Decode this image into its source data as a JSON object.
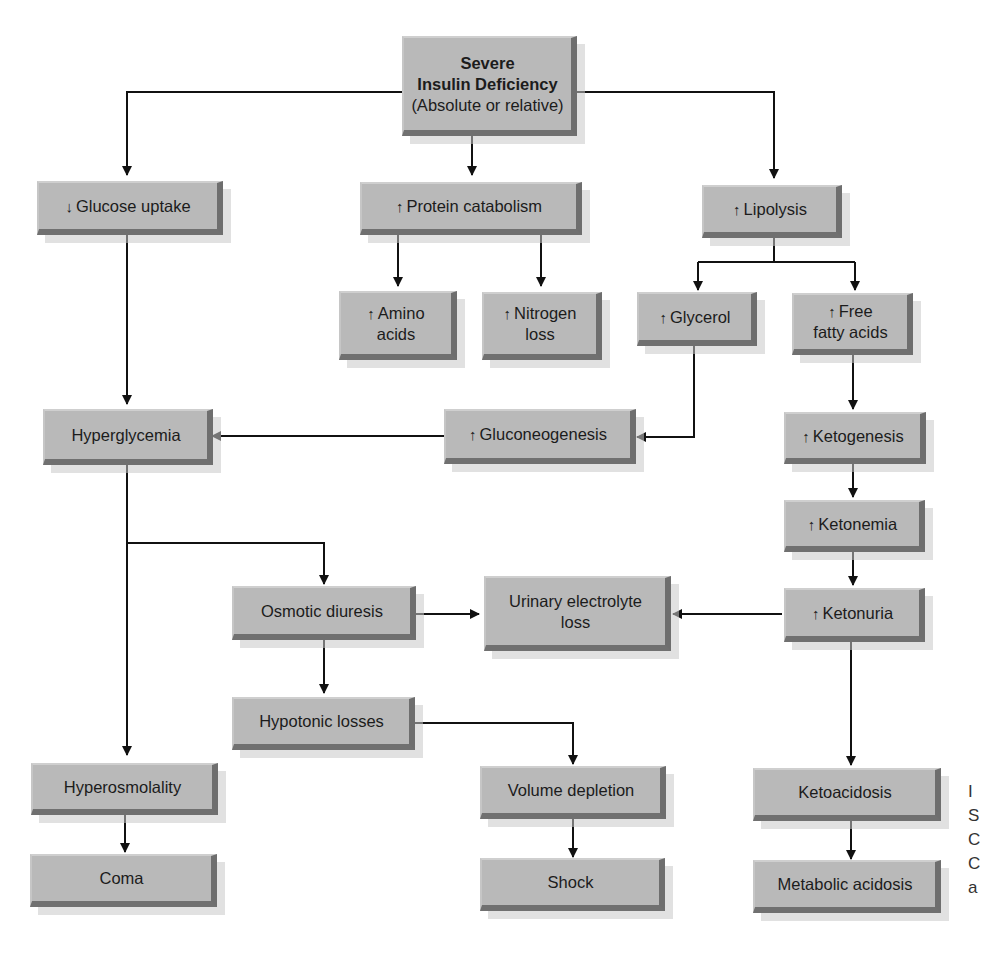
{
  "diagram": {
    "type": "flowchart",
    "arrow_up": "↑",
    "arrow_down": "↓",
    "nodes": {
      "root": {
        "line1": "Severe",
        "line2": "Insulin Deficiency",
        "line3": "(Absolute or relative)"
      },
      "glucose_uptake": {
        "prefix": "↓",
        "label": "Glucose uptake"
      },
      "protein_catabolism": {
        "prefix": "↑",
        "label": "Protein catabolism"
      },
      "lipolysis": {
        "prefix": "↑",
        "label": "Lipolysis"
      },
      "amino_acids": {
        "prefix": "↑",
        "line1": "Amino",
        "line2": "acids"
      },
      "nitrogen_loss": {
        "prefix": "↑",
        "line1": "Nitrogen",
        "line2": "loss"
      },
      "glycerol": {
        "prefix": "↑",
        "label": "Glycerol"
      },
      "free_fatty_acids": {
        "prefix": "↑",
        "line1": "Free",
        "line2": "fatty acids"
      },
      "hyperglycemia": {
        "label": "Hyperglycemia"
      },
      "gluconeogenesis": {
        "prefix": "↑",
        "label": "Gluconeogenesis"
      },
      "ketogenesis": {
        "prefix": "↑",
        "label": "Ketogenesis"
      },
      "ketonemia": {
        "prefix": "↑",
        "label": "Ketonemia"
      },
      "osmotic_diuresis": {
        "label": "Osmotic diuresis"
      },
      "urinary_electrolyte_loss": {
        "line1": "Urinary electrolyte",
        "line2": "loss"
      },
      "ketonuria": {
        "prefix": "↑",
        "label": "Ketonuria"
      },
      "hypotonic_losses": {
        "label": "Hypotonic losses"
      },
      "hyperosmolality": {
        "label": "Hyperosmolality"
      },
      "volume_depletion": {
        "label": "Volume depletion"
      },
      "ketoacidosis": {
        "label": "Ketoacidosis"
      },
      "coma": {
        "label": "Coma"
      },
      "shock": {
        "label": "Shock"
      },
      "metabolic_acidosis": {
        "label": "Metabolic acidosis"
      }
    },
    "edges": [
      [
        "root",
        "glucose_uptake"
      ],
      [
        "root",
        "protein_catabolism"
      ],
      [
        "root",
        "lipolysis"
      ],
      [
        "protein_catabolism",
        "amino_acids"
      ],
      [
        "protein_catabolism",
        "nitrogen_loss"
      ],
      [
        "lipolysis",
        "glycerol"
      ],
      [
        "lipolysis",
        "free_fatty_acids"
      ],
      [
        "glucose_uptake",
        "hyperglycemia"
      ],
      [
        "glycerol",
        "gluconeogenesis"
      ],
      [
        "gluconeogenesis",
        "hyperglycemia"
      ],
      [
        "free_fatty_acids",
        "ketogenesis"
      ],
      [
        "ketogenesis",
        "ketonemia"
      ],
      [
        "ketonemia",
        "ketonuria"
      ],
      [
        "hyperglycemia",
        "osmotic_diuresis"
      ],
      [
        "hyperglycemia",
        "hyperosmolality"
      ],
      [
        "osmotic_diuresis",
        "urinary_electrolyte_loss"
      ],
      [
        "ketonuria",
        "urinary_electrolyte_loss"
      ],
      [
        "osmotic_diuresis",
        "hypotonic_losses"
      ],
      [
        "hypotonic_losses",
        "volume_depletion"
      ],
      [
        "ketonuria",
        "ketoacidosis"
      ],
      [
        "hyperosmolality",
        "coma"
      ],
      [
        "volume_depletion",
        "shock"
      ],
      [
        "ketoacidosis",
        "metabolic_acidosis"
      ]
    ],
    "colors": {
      "box_fill": "#b9b9b9",
      "box_shadow_edge": "#6e6e6e",
      "line": "#111111"
    }
  },
  "caption_fragment": {
    "c1": "I",
    "c2": "S",
    "c3": "C",
    "c4": "C",
    "c5": "a"
  }
}
